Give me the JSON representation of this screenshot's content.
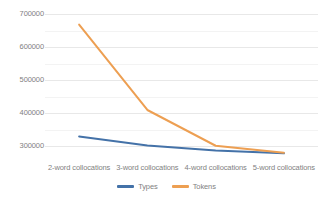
{
  "chart_data": {
    "type": "line",
    "title": "",
    "xlabel": "",
    "ylabel": "",
    "categories": [
      "2-word collocations",
      "3-word collocations",
      "4-word collocations",
      "5-word collocations"
    ],
    "series": [
      {
        "name": "Types",
        "color": "#4472a8",
        "values": [
          330000,
          303000,
          288000,
          279000
        ]
      },
      {
        "name": "Tokens",
        "color": "#ed9f52",
        "values": [
          668000,
          410000,
          302000,
          281000
        ]
      }
    ],
    "ylim": [
      265000,
      712000
    ],
    "yticks": [
      300000,
      400000,
      500000,
      600000,
      700000
    ],
    "ytick_labels": [
      "300000",
      "400000",
      "500000",
      "600000",
      "700000"
    ],
    "gridlines": true,
    "minor_gridlines": true,
    "legend_position": "bottom"
  },
  "legend": {
    "items": [
      {
        "label": "Types",
        "color": "#4472a8"
      },
      {
        "label": "Tokens",
        "color": "#ed9f52"
      }
    ]
  },
  "colors": {
    "types": "#4472a8",
    "tokens": "#ed9f52",
    "gridline": "#e8e8e8",
    "text": "#7f7f7f",
    "background": "#ffffff"
  }
}
